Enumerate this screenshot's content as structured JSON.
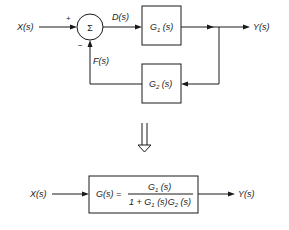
{
  "diagram": {
    "type": "block-diagram-feedback-reduction",
    "top": {
      "input_label": "X(s)",
      "summing_symbol": "Σ",
      "plus_sign": "+",
      "minus_sign": "−",
      "error_label": "D(s)",
      "forward_block": {
        "name": "G",
        "sub": "1",
        "arg": " (s)"
      },
      "feedback_block": {
        "name": "G",
        "sub": "2",
        "arg": " (s)"
      },
      "feedback_label": "F(s)",
      "output_label": "Y(s)"
    },
    "reduction_arrow": "⇓",
    "bottom": {
      "input_label": "X(s)",
      "lhs": "G(s) =",
      "numerator": {
        "name": "G",
        "sub": "1",
        "arg": " (s)"
      },
      "denominator": {
        "prefix": "1 + ",
        "g1": "G",
        "g1_sub": "1",
        "g1_arg": " (s)",
        "g2": "G",
        "g2_sub": "2",
        "g2_arg": " (s)"
      },
      "output_label": "Y(s)"
    }
  }
}
